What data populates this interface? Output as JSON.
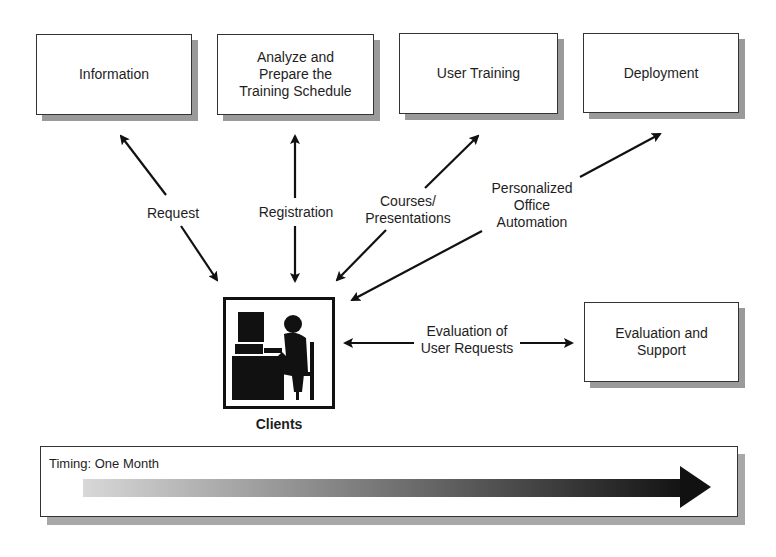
{
  "diagram": {
    "top_boxes": [
      {
        "label": "Information"
      },
      {
        "label": "Analyze and\nPrepare the\nTraining Schedule"
      },
      {
        "label": "User Training"
      },
      {
        "label": "Deployment"
      }
    ],
    "side_box": {
      "label": "Evaluation and\nSupport"
    },
    "client": {
      "label": "Clients",
      "icon": "person-at-computer-icon"
    },
    "edges": [
      {
        "label": "Request",
        "from": "Clients",
        "to": "Information",
        "direction": "bidirectional"
      },
      {
        "label": "Registration",
        "from": "Clients",
        "to": "Analyze and Prepare the Training Schedule",
        "direction": "bidirectional"
      },
      {
        "label": "Courses/\nPresentations",
        "from": "Clients",
        "to": "User Training",
        "direction": "bidirectional"
      },
      {
        "label": "Personalized\nOffice\nAutomation",
        "from": "Clients",
        "to": "Deployment",
        "direction": "bidirectional"
      },
      {
        "label": "Evaluation of\nUser Requests",
        "from": "Clients",
        "to": "Evaluation and Support",
        "direction": "bidirectional"
      }
    ],
    "timing": {
      "label": "Timing: One Month",
      "gradient_start": "#d8d8d8",
      "gradient_end": "#111111"
    }
  }
}
